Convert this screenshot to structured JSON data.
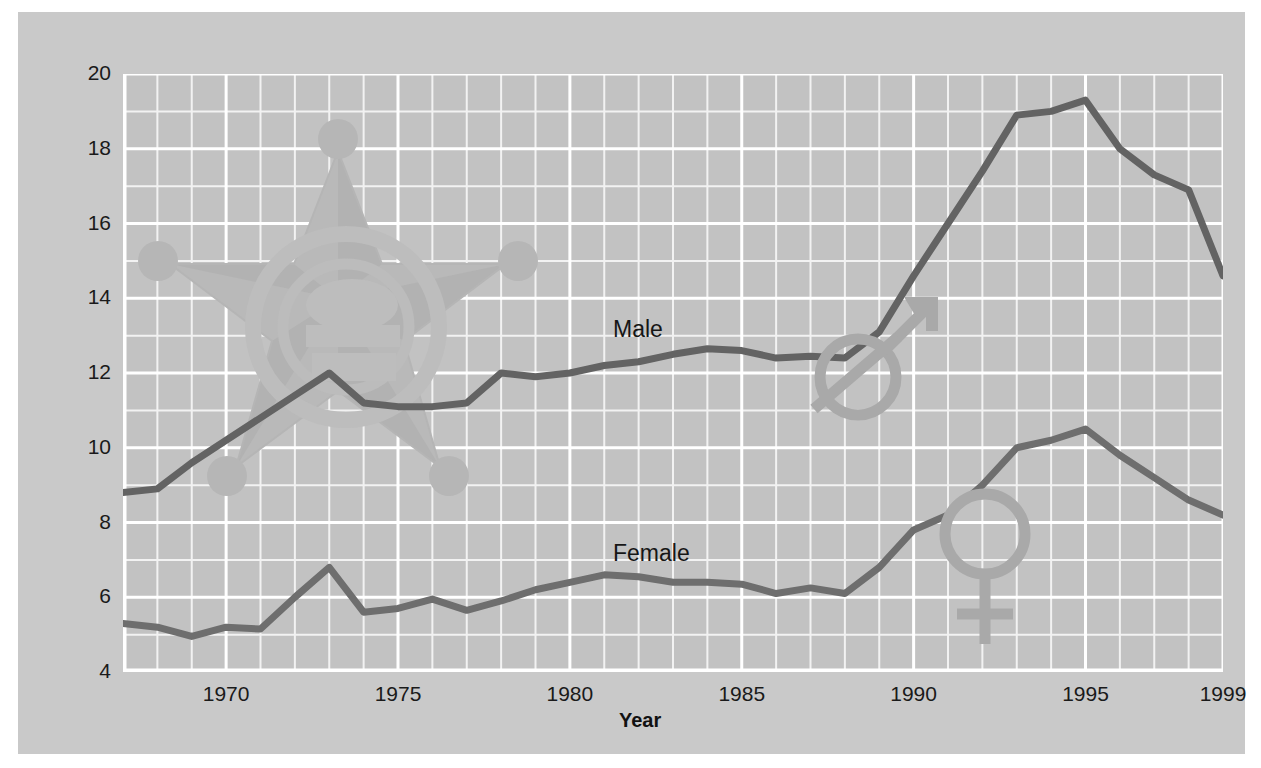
{
  "chart_data": {
    "type": "line",
    "title": "",
    "xlabel": "Year",
    "ylabel": "",
    "xlim": [
      1967,
      1999
    ],
    "ylim": [
      4,
      20
    ],
    "grid": true,
    "legend_position": "inline-series-labels",
    "x_tick_labels": [
      "1970",
      "1975",
      "1980",
      "1985",
      "1990",
      "1995",
      "1999"
    ],
    "x_ticks": [
      1970,
      1975,
      1980,
      1985,
      1990,
      1995,
      1999
    ],
    "y_tick_labels": [
      "4",
      "6",
      "8",
      "10",
      "12",
      "14",
      "16",
      "18",
      "20"
    ],
    "y_ticks": [
      4,
      6,
      8,
      10,
      12,
      14,
      16,
      18,
      20
    ],
    "x": [
      1967,
      1968,
      1969,
      1970,
      1971,
      1972,
      1973,
      1974,
      1975,
      1976,
      1977,
      1978,
      1979,
      1980,
      1981,
      1982,
      1983,
      1984,
      1985,
      1986,
      1987,
      1988,
      1989,
      1990,
      1991,
      1992,
      1993,
      1994,
      1995,
      1996,
      1997,
      1998,
      1999
    ],
    "series": [
      {
        "name": "Male",
        "label": "Male",
        "color": "#636363",
        "values": [
          8.8,
          8.9,
          9.6,
          10.2,
          10.8,
          11.4,
          12.0,
          11.2,
          11.1,
          11.1,
          11.2,
          12.0,
          11.9,
          12.0,
          12.2,
          12.3,
          12.5,
          12.65,
          12.6,
          12.4,
          12.45,
          12.4,
          13.1,
          14.6,
          16.0,
          17.4,
          18.9,
          19.0,
          19.3,
          18.0,
          17.3,
          16.9,
          14.6
        ]
      },
      {
        "name": "Female",
        "label": "Female",
        "color": "#6e6e6e",
        "values": [
          5.3,
          5.2,
          4.95,
          5.2,
          5.15,
          6.0,
          6.8,
          5.6,
          5.7,
          5.95,
          5.65,
          5.9,
          6.2,
          6.4,
          6.6,
          6.55,
          6.4,
          6.4,
          6.35,
          6.1,
          6.25,
          6.1,
          6.8,
          7.8,
          8.2,
          9.0,
          10.0,
          10.2,
          10.5,
          9.8,
          9.2,
          8.6,
          8.2
        ]
      }
    ]
  },
  "axis": {
    "x_title": "Year"
  },
  "watermarks": {
    "badge": "sheriff-star-badge",
    "male_symbol": "male-gender-symbol",
    "female_symbol": "female-gender-symbol"
  },
  "colors": {
    "page_background": "#ffffff",
    "panel_background": "#c9c9c9",
    "plot_background": "#c2c2c2",
    "gridline_major": "#ffffff",
    "gridline_minor": "#f2f2f2",
    "male_line": "#636363",
    "female_line": "#6e6e6e",
    "text": "#1a1a1a",
    "watermark": "#b9b9b9"
  }
}
